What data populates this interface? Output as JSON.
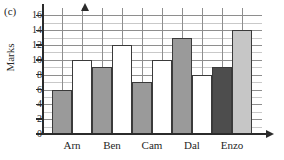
{
  "figure": {
    "part_label": "(c)",
    "y_axis_title": "Marks"
  },
  "chart_data": {
    "type": "bar",
    "title": "",
    "xlabel": "",
    "ylabel": "Marks",
    "categories": [
      "Arn",
      "Ben",
      "Cam",
      "Dal",
      "Enzo"
    ],
    "series": [
      {
        "name": "first",
        "values": [
          6,
          9,
          7,
          13,
          9
        ]
      },
      {
        "name": "second",
        "values": [
          10,
          12,
          10,
          8,
          14
        ]
      }
    ],
    "ylim": [
      0,
      17
    ],
    "y_ticks": [
      0,
      2,
      4,
      6,
      8,
      10,
      12,
      14,
      16
    ],
    "y_tick_labels": [
      "0",
      "2",
      "4",
      "6",
      "8",
      "10",
      "12",
      "14",
      "16"
    ],
    "grid": true,
    "grid_minor_step": 1,
    "grid_major_step": 2,
    "legend": "none",
    "bar_styles": [
      {
        "category": "Arn",
        "first_fill": "#9a9a9a",
        "second_fill": "#ffffff"
      },
      {
        "category": "Ben",
        "first_fill": "#9a9a9a",
        "second_fill": "#ffffff"
      },
      {
        "category": "Cam",
        "first_fill": "#9a9a9a",
        "second_fill": "#ffffff"
      },
      {
        "category": "Dal",
        "first_fill": "#9a9a9a",
        "second_fill": "#ffffff"
      },
      {
        "category": "Enzo",
        "first_fill": "#4d4d4d",
        "second_fill": "#c6c6c6"
      }
    ],
    "bar_edge_color": "#3a3a3a",
    "axis_color": "#2b2b2b",
    "grid_color_minor": "#c9c9c9",
    "grid_color_major": "#8e8e8e"
  }
}
